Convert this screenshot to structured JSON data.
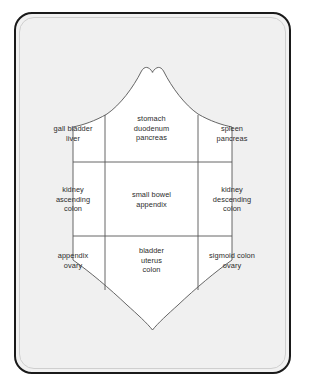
{
  "frame": {
    "border_color": "#1a1a1a",
    "background_color": "#f0f0f0"
  },
  "diagram": {
    "shape": "shield",
    "outline_color": "#555555",
    "fill_color": "#ffffff",
    "grid_rows": 3,
    "grid_columns": 3,
    "cells": [
      {
        "row": 0,
        "col": 0,
        "name": "right-upper-quadrant",
        "lines": [
          "gall bladder",
          "liver"
        ]
      },
      {
        "row": 0,
        "col": 1,
        "name": "epigastric-region",
        "lines": [
          "stomach",
          "duodenum",
          "pancreas"
        ]
      },
      {
        "row": 0,
        "col": 2,
        "name": "left-upper-quadrant",
        "lines": [
          "spleen",
          "pancreas"
        ]
      },
      {
        "row": 1,
        "col": 0,
        "name": "right-flank-region",
        "lines": [
          "kidney",
          "ascending",
          "colon"
        ]
      },
      {
        "row": 1,
        "col": 1,
        "name": "umbilical-region",
        "lines": [
          "small bowel",
          "appendix"
        ]
      },
      {
        "row": 1,
        "col": 2,
        "name": "left-flank-region",
        "lines": [
          "kidney",
          "descending",
          "colon"
        ]
      },
      {
        "row": 2,
        "col": 0,
        "name": "right-lower-quadrant",
        "lines": [
          "appendix",
          "ovary"
        ]
      },
      {
        "row": 2,
        "col": 1,
        "name": "suprapubic-region",
        "lines": [
          "bladder",
          "uterus",
          "colon"
        ]
      },
      {
        "row": 2,
        "col": 2,
        "name": "left-lower-quadrant",
        "lines": [
          "sigmoid colon",
          "ovary"
        ]
      }
    ]
  }
}
